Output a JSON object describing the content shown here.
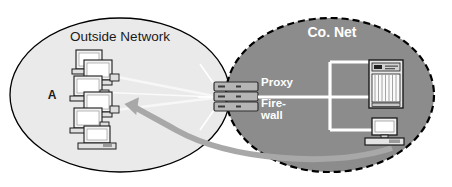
{
  "diagram": {
    "canvas": {
      "width": 452,
      "height": 187,
      "background": "#ffffff"
    }
  },
  "zones": {
    "outside": {
      "label": "Outside Network",
      "marker": "A",
      "fill": "#eaeaea",
      "stroke": "#000000",
      "border_style": "solid"
    },
    "company": {
      "label": "Co. Net",
      "fill": "#8c8c8c",
      "stroke": "#000000",
      "border_style": "dashed"
    }
  },
  "gateway": {
    "name": "proxy-firewall",
    "labels": {
      "proxy": "Proxy",
      "firewall_line1": "Fire-",
      "firewall_line2": "wall"
    },
    "unit_count": 3,
    "fill": "#b5b5b5",
    "stroke": "#303030"
  },
  "nodes": {
    "outside_clients": {
      "name": "client-computer-stack",
      "count": 5,
      "fill": "#f2f2f2",
      "stroke": "#1a1a1a"
    },
    "mainframe": {
      "name": "mainframe-server",
      "fill": "#e8e8e8",
      "stroke": "#1a1a1a"
    },
    "workstation": {
      "name": "desktop-workstation",
      "fill": "#f2f2f2",
      "stroke": "#1a1a1a"
    }
  },
  "links": {
    "internal_bus_color": "#ffffff",
    "external_link_color": "#f5f5f5",
    "flow_arrow_color": "#a8a8a8",
    "flow_arrow_direction": "right-to-left"
  }
}
